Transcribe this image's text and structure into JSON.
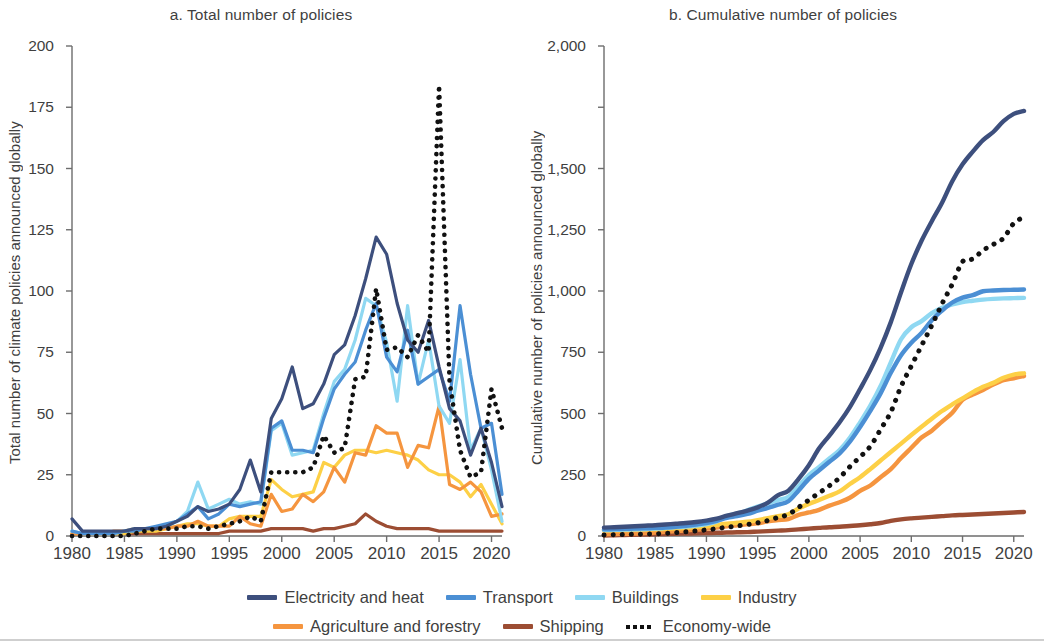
{
  "figure": {
    "panels": [
      {
        "id": "a",
        "title": "a. Total number of policies",
        "ylabel": "Total number of climate policies announced globally"
      },
      {
        "id": "b",
        "title": "b. Cumulative number of policies",
        "ylabel": "Cumulative number of policies announced globally"
      }
    ]
  },
  "legend": {
    "rows": [
      [
        {
          "label": "Electricity and heat",
          "color": "#3d4f7d",
          "style": "solid"
        },
        {
          "label": "Transport",
          "color": "#4b8fd4",
          "style": "solid"
        },
        {
          "label": "Buildings",
          "color": "#8fd8f2",
          "style": "solid"
        },
        {
          "label": "Industry",
          "color": "#fdd046",
          "style": "solid"
        }
      ],
      [
        {
          "label": "Agriculture and forestry",
          "color": "#f5953f",
          "style": "solid"
        },
        {
          "label": "Shipping",
          "color": "#9c4d33",
          "style": "solid"
        },
        {
          "label": "Economy-wide",
          "color": "#111111",
          "style": "dotted"
        }
      ]
    ]
  },
  "chart_data": [
    {
      "type": "line",
      "panel": "a",
      "title": "a. Total number of policies",
      "xlabel": "",
      "ylabel": "Total number of climate policies announced globally",
      "xlim": [
        1980,
        2021
      ],
      "ylim": [
        0,
        200
      ],
      "yticks": [
        0,
        25,
        50,
        75,
        100,
        125,
        150,
        175,
        200
      ],
      "ytick_labels": [
        "0",
        "25",
        "50",
        "75",
        "100",
        "125",
        "150",
        "175",
        "200"
      ],
      "xticks": [
        1980,
        1985,
        1990,
        1995,
        2000,
        2005,
        2010,
        2015,
        2020
      ],
      "xtick_labels": [
        "1980",
        "1985",
        "1990",
        "1995",
        "2000",
        "2005",
        "2010",
        "2015",
        "2020"
      ],
      "grid": false,
      "legend_position": "bottom",
      "x": [
        1980,
        1981,
        1982,
        1983,
        1984,
        1985,
        1986,
        1987,
        1988,
        1989,
        1990,
        1991,
        1992,
        1993,
        1994,
        1995,
        1996,
        1997,
        1998,
        1999,
        2000,
        2001,
        2002,
        2003,
        2004,
        2005,
        2006,
        2007,
        2008,
        2009,
        2010,
        2011,
        2012,
        2013,
        2014,
        2015,
        2016,
        2017,
        2018,
        2019,
        2020,
        2021
      ],
      "series": [
        {
          "name": "Electricity and heat",
          "color": "#3d4f7d",
          "style": "solid",
          "values": [
            7,
            2,
            2,
            2,
            2,
            2,
            3,
            3,
            3,
            4,
            6,
            8,
            12,
            10,
            11,
            13,
            19,
            31,
            18,
            48,
            56,
            69,
            52,
            54,
            62,
            74,
            78,
            90,
            105,
            122,
            115,
            95,
            80,
            75,
            88,
            69,
            52,
            47,
            33,
            44,
            30,
            12
          ]
        },
        {
          "name": "Transport",
          "color": "#4b8fd4",
          "style": "solid",
          "values": [
            2,
            1,
            1,
            1,
            1,
            2,
            2,
            3,
            4,
            5,
            6,
            9,
            12,
            7,
            9,
            13,
            12,
            13,
            14,
            44,
            47,
            35,
            35,
            34,
            48,
            60,
            66,
            71,
            84,
            95,
            73,
            67,
            84,
            62,
            65,
            68,
            55,
            94,
            66,
            44,
            46,
            17
          ]
        },
        {
          "name": "Buildings",
          "color": "#8fd8f2",
          "style": "solid",
          "values": [
            2,
            1,
            1,
            1,
            1,
            2,
            3,
            3,
            3,
            4,
            6,
            10,
            22,
            11,
            13,
            15,
            13,
            14,
            13,
            43,
            46,
            33,
            34,
            35,
            50,
            63,
            68,
            80,
            97,
            94,
            79,
            55,
            94,
            62,
            80,
            53,
            46,
            72,
            35,
            44,
            27,
            6
          ]
        },
        {
          "name": "Industry",
          "color": "#fdd046",
          "style": "solid",
          "values": [
            1,
            1,
            1,
            1,
            1,
            1,
            2,
            2,
            2,
            3,
            4,
            5,
            5,
            4,
            4,
            7,
            8,
            8,
            8,
            23,
            19,
            16,
            17,
            18,
            30,
            28,
            33,
            35,
            35,
            34,
            35,
            34,
            33,
            31,
            27,
            25,
            25,
            22,
            16,
            21,
            13,
            5
          ]
        },
        {
          "name": "Agriculture and forestry",
          "color": "#f5953f",
          "style": "solid",
          "values": [
            1,
            1,
            1,
            1,
            2,
            2,
            3,
            3,
            3,
            3,
            4,
            4,
            6,
            4,
            4,
            4,
            8,
            5,
            4,
            17,
            10,
            11,
            17,
            14,
            18,
            28,
            22,
            34,
            33,
            45,
            42,
            42,
            28,
            37,
            36,
            53,
            21,
            19,
            22,
            18,
            8,
            9
          ]
        },
        {
          "name": "Shipping",
          "color": "#9c4d33",
          "style": "solid",
          "values": [
            1,
            1,
            1,
            1,
            1,
            1,
            1,
            1,
            1,
            1,
            1,
            1,
            1,
            1,
            1,
            2,
            2,
            2,
            2,
            3,
            3,
            3,
            3,
            2,
            3,
            3,
            4,
            5,
            9,
            6,
            4,
            3,
            3,
            3,
            3,
            2,
            2,
            2,
            2,
            2,
            2,
            2
          ]
        },
        {
          "name": "Economy-wide",
          "color": "#111111",
          "style": "dotted",
          "values": [
            0,
            0,
            0,
            0,
            0,
            0,
            1,
            2,
            3,
            3,
            3,
            4,
            4,
            3,
            4,
            5,
            6,
            8,
            6,
            26,
            26,
            26,
            26,
            28,
            41,
            34,
            36,
            64,
            65,
            101,
            76,
            77,
            73,
            82,
            75,
            184,
            63,
            35,
            24,
            26,
            60,
            44
          ]
        }
      ]
    },
    {
      "type": "line",
      "panel": "b",
      "title": "b. Cumulative number of policies",
      "xlabel": "",
      "ylabel": "Cumulative number of policies announced globally",
      "xlim": [
        1980,
        2021
      ],
      "ylim": [
        0,
        2000
      ],
      "yticks": [
        0,
        250,
        500,
        750,
        1000,
        1250,
        1500,
        1750,
        2000
      ],
      "ytick_labels": [
        "0",
        "250",
        "500",
        "750",
        "1,000",
        "1,250",
        "1,500",
        "",
        "2,000"
      ],
      "xticks": [
        1980,
        1985,
        1990,
        1995,
        2000,
        2005,
        2010,
        2015,
        2020
      ],
      "xtick_labels": [
        "1980",
        "1985",
        "1990",
        "1995",
        "2000",
        "2005",
        "2010",
        "2015",
        "2020"
      ],
      "grid": false,
      "legend_position": "bottom",
      "x": [
        1980,
        1981,
        1982,
        1983,
        1984,
        1985,
        1986,
        1987,
        1988,
        1989,
        1990,
        1991,
        1992,
        1993,
        1994,
        1995,
        1996,
        1997,
        1998,
        1999,
        2000,
        2001,
        2002,
        2003,
        2004,
        2005,
        2006,
        2007,
        2008,
        2009,
        2010,
        2011,
        2012,
        2013,
        2014,
        2015,
        2016,
        2017,
        2018,
        2019,
        2020,
        2021
      ],
      "series": [
        {
          "name": "Electricity and heat",
          "color": "#3d4f7d",
          "style": "solid",
          "values": [
            34,
            36,
            38,
            40,
            42,
            44,
            47,
            50,
            53,
            57,
            63,
            71,
            83,
            93,
            104,
            117,
            136,
            167,
            185,
            233,
            289,
            358,
            410,
            464,
            526,
            600,
            678,
            768,
            873,
            995,
            1110,
            1205,
            1285,
            1360,
            1448,
            1517,
            1569,
            1616,
            1649,
            1693,
            1723,
            1735
          ]
        },
        {
          "name": "Economy-wide",
          "color": "#111111",
          "style": "dotted",
          "values": [
            4,
            5,
            6,
            7,
            8,
            9,
            11,
            14,
            17,
            21,
            25,
            30,
            36,
            41,
            47,
            54,
            63,
            76,
            88,
            117,
            147,
            176,
            205,
            238,
            283,
            323,
            366,
            435,
            506,
            611,
            694,
            777,
            860,
            948,
            1028,
            1120,
            1131,
            1166,
            1190,
            1216,
            1276,
            1302
          ]
        },
        {
          "name": "Transport",
          "color": "#4b8fd4",
          "style": "solid",
          "values": [
            27,
            28,
            29,
            30,
            31,
            33,
            35,
            38,
            42,
            47,
            53,
            62,
            74,
            81,
            90,
            103,
            115,
            128,
            142,
            186,
            233,
            268,
            303,
            337,
            385,
            445,
            511,
            582,
            666,
            738,
            789,
            829,
            881,
            920,
            953,
            973,
            983,
            999,
            1002,
            1004,
            1005,
            1006
          ]
        },
        {
          "name": "Buildings",
          "color": "#8fd8f2",
          "style": "solid",
          "values": [
            24,
            25,
            26,
            27,
            28,
            30,
            33,
            36,
            39,
            43,
            49,
            59,
            81,
            92,
            105,
            120,
            133,
            147,
            160,
            203,
            249,
            282,
            316,
            351,
            401,
            464,
            532,
            612,
            709,
            803,
            852,
            877,
            910,
            932,
            945,
            955,
            960,
            965,
            968,
            970,
            971,
            972
          ]
        },
        {
          "name": "Industry",
          "color": "#fdd046",
          "style": "solid",
          "values": [
            22,
            23,
            24,
            25,
            26,
            27,
            29,
            31,
            33,
            36,
            40,
            45,
            50,
            54,
            58,
            65,
            73,
            81,
            89,
            112,
            131,
            147,
            164,
            182,
            212,
            240,
            273,
            308,
            343,
            377,
            412,
            446,
            479,
            510,
            537,
            562,
            587,
            609,
            625,
            646,
            659,
            664
          ]
        },
        {
          "name": "Agriculture and forestry",
          "color": "#f5953f",
          "style": "solid",
          "values": [
            7,
            8,
            9,
            10,
            12,
            14,
            17,
            20,
            23,
            26,
            30,
            34,
            40,
            44,
            48,
            52,
            60,
            65,
            69,
            86,
            96,
            107,
            124,
            138,
            156,
            184,
            206,
            240,
            273,
            318,
            360,
            402,
            430,
            467,
            503,
            556,
            577,
            596,
            618,
            636,
            644,
            653
          ]
        },
        {
          "name": "Shipping",
          "color": "#9c4d33",
          "style": "solid",
          "values": [
            2,
            3,
            4,
            5,
            6,
            7,
            8,
            9,
            10,
            11,
            12,
            13,
            14,
            15,
            16,
            18,
            20,
            22,
            24,
            27,
            30,
            33,
            36,
            38,
            41,
            44,
            48,
            53,
            62,
            68,
            72,
            75,
            78,
            81,
            84,
            86,
            88,
            90,
            92,
            94,
            96,
            98
          ]
        }
      ]
    }
  ]
}
